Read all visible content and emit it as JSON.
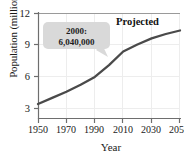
{
  "chart_data": {
    "type": "line",
    "title": "",
    "xlabel": "Year",
    "ylabel": "Population (millions)",
    "xlim": [
      1950,
      2050
    ],
    "ylim": [
      0,
      12
    ],
    "grid": true,
    "legend_position": "none",
    "x_ticks": [
      "1950",
      "1970",
      "1990",
      "2010",
      "2030",
      "2050"
    ],
    "y_ticks": [
      "3",
      "6",
      "9",
      "12"
    ],
    "x": [
      1950,
      1960,
      1970,
      1980,
      1990,
      2000,
      2010,
      2020,
      2030,
      2040,
      2050
    ],
    "series": [
      {
        "name": "World population",
        "values": [
          1.6,
          2.3,
          3.0,
          3.8,
          4.7,
          6.04,
          7.6,
          8.4,
          9.1,
          9.6,
          10.0
        ],
        "color": "#4a4a4a"
      }
    ],
    "annotations": [
      {
        "name": "projected-label",
        "text": "Projected",
        "x": 2032,
        "y": 11.1
      },
      {
        "name": "callout-2000",
        "line1": "2000:",
        "line2": "6,040,000",
        "points_to_x": 2000,
        "points_to_y": 6.04,
        "fill": "#d9d9d9"
      }
    ],
    "axis_color": "#6e6e6e",
    "grid_color": "#ededed",
    "text_color": "#1a1a1a",
    "background": "#ffffff"
  },
  "axes": {
    "y_label": "Population (millions)",
    "x_label": "Year",
    "y_ticks": [
      {
        "label": "12",
        "top": 8
      },
      {
        "label": "9",
        "top": 40
      },
      {
        "label": "6",
        "top": 72
      },
      {
        "label": "3",
        "top": 104
      }
    ],
    "x_ticks": [
      {
        "label": "1950",
        "left": 23
      },
      {
        "label": "1970",
        "left": 51
      },
      {
        "label": "1990",
        "left": 79
      },
      {
        "label": "2010",
        "left": 108
      },
      {
        "label": "2030",
        "left": 136
      },
      {
        "label": "2050",
        "left": 164
      }
    ]
  },
  "callout": {
    "line1": "2000:",
    "line2": "6,040,000"
  },
  "projected": {
    "label": "Projected"
  }
}
